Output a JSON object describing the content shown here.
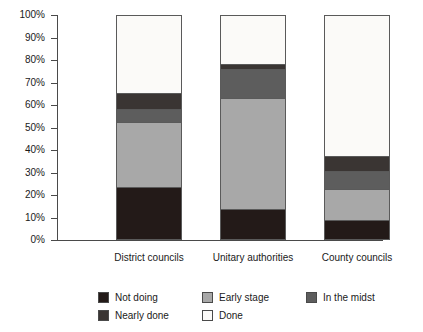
{
  "chart_data": {
    "type": "bar",
    "subtype": "stacked-bar-100-percent",
    "title": "",
    "xlabel": "",
    "ylabel": "",
    "ylim": [
      0,
      100
    ],
    "grid": false,
    "legend_position": "bottom",
    "categories": [
      "District councils",
      "Unitary authorities",
      "County councils"
    ],
    "tick_labels": [
      "0%",
      "10%",
      "20%",
      "30%",
      "40%",
      "50%",
      "60%",
      "70%",
      "80%",
      "90%",
      "100%"
    ],
    "tick_values": [
      0,
      10,
      20,
      30,
      40,
      50,
      60,
      70,
      80,
      90,
      100
    ],
    "series": [
      {
        "name": "Not doing",
        "color": "#231a18",
        "values": [
          23,
          13,
          8
        ]
      },
      {
        "name": "Early stage",
        "color": "#a8a8a8",
        "values": [
          29,
          50,
          14
        ]
      },
      {
        "name": "In the midst",
        "color": "#5d5d5d",
        "values": [
          6,
          13,
          8
        ]
      },
      {
        "name": "Nearly done",
        "color": "#3a3533",
        "values": [
          7,
          2,
          7
        ]
      },
      {
        "name": "Done",
        "color": "#fbfaf8",
        "values": [
          35,
          22,
          63
        ]
      }
    ]
  },
  "legend": {
    "row1": [
      {
        "label": "Not doing",
        "color": "#231a18"
      },
      {
        "label": "Early stage",
        "color": "#a8a8a8"
      },
      {
        "label": "In the midst",
        "color": "#5d5d5d"
      }
    ],
    "row2": [
      {
        "label": "Nearly done",
        "color": "#3a3533"
      },
      {
        "label": "Done",
        "color": "#fbfaf8"
      }
    ]
  }
}
